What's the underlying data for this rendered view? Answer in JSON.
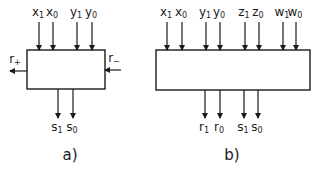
{
  "diagrams": [
    {
      "caption": "a)",
      "box": {
        "x": 27,
        "y": 50,
        "w": 78,
        "h": 39
      },
      "inputs_top": [
        {
          "base": "x",
          "sub": "1",
          "x": 39
        },
        {
          "base": "x",
          "sub": "0",
          "x": 53
        },
        {
          "base": "y",
          "sub": "1",
          "x": 77
        },
        {
          "base": "y",
          "sub": "0",
          "x": 92
        }
      ],
      "outputs_bottom": [
        {
          "base": "s",
          "sub": "1",
          "x": 58
        },
        {
          "base": "s",
          "sub": "0",
          "x": 73
        }
      ],
      "side_left": {
        "base": "r",
        "sub": "+",
        "direction": "out"
      },
      "side_right": {
        "base": "r",
        "sub": "−",
        "direction": "in"
      }
    },
    {
      "caption": "b)",
      "box": {
        "x": 156,
        "y": 50,
        "w": 154,
        "h": 40
      },
      "inputs_top": [
        {
          "base": "x",
          "sub": "1",
          "x": 167
        },
        {
          "base": "x",
          "sub": "0",
          "x": 182
        },
        {
          "base": "y",
          "sub": "1",
          "x": 206
        },
        {
          "base": "y",
          "sub": "0",
          "x": 220
        },
        {
          "base": "z",
          "sub": "1",
          "x": 245
        },
        {
          "base": "z",
          "sub": "0",
          "x": 259
        },
        {
          "base": "w",
          "sub": "1",
          "x": 283
        },
        {
          "base": "w",
          "sub": "0",
          "x": 296
        }
      ],
      "outputs_bottom": [
        {
          "base": "r",
          "sub": "1",
          "x": 205
        },
        {
          "base": "r",
          "sub": "0",
          "x": 220
        },
        {
          "base": "s",
          "sub": "1",
          "x": 244
        },
        {
          "base": "s",
          "sub": "0",
          "x": 258
        }
      ]
    }
  ]
}
